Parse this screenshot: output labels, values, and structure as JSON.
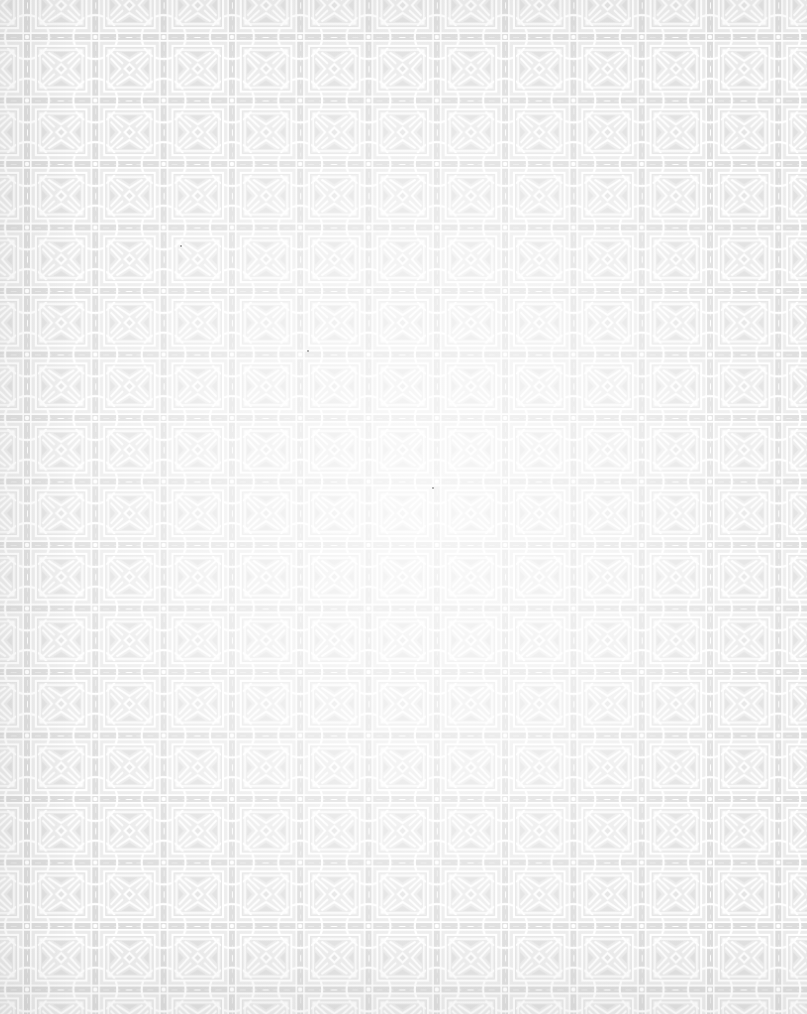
{
  "texture": {
    "name": "Geometric lattice tile pattern",
    "tile_width": 68.3,
    "tile_height": 63.5,
    "offset_x": 27,
    "offset_y": 37,
    "colors": {
      "base": "#e9e9e9",
      "band": "#dedede",
      "strap": "#ffffff",
      "background_center": "#fbfbfb",
      "background_edge": "#e6e6e6",
      "speck": "#9a9a9a"
    }
  },
  "specks": [
    {
      "x": 432,
      "y": 487
    },
    {
      "x": 307,
      "y": 350
    },
    {
      "x": 180,
      "y": 245
    }
  ]
}
